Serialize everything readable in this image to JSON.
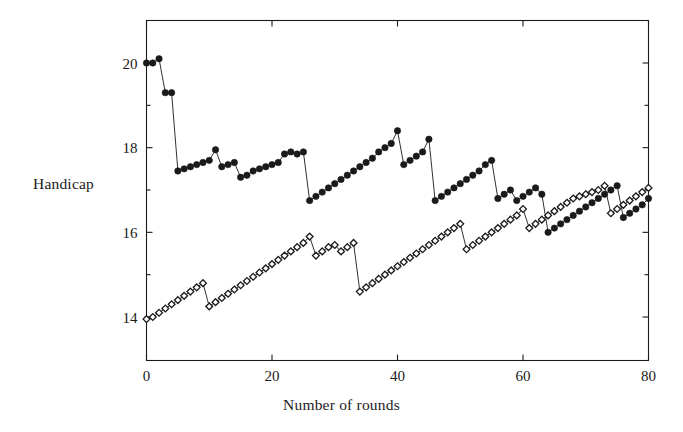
{
  "figure": {
    "background_color": "#ffffff",
    "ink_color": "#1a1a1a"
  },
  "axis": {
    "y_title": "Handicap",
    "x_title": "Number of rounds",
    "x_ticks": [
      "0",
      "20",
      "40",
      "60",
      "80"
    ],
    "y_ticks": [
      "14",
      "16",
      "18",
      "20"
    ]
  },
  "chart_data": {
    "type": "line",
    "title": "",
    "subtitle": "",
    "xlabel": "Number of rounds",
    "ylabel": "Handicap",
    "xlim": [
      0,
      80
    ],
    "ylim": [
      13.0,
      21.2
    ],
    "xticks": [
      0,
      20,
      40,
      60,
      80
    ],
    "yticks": [
      14,
      16,
      18,
      20
    ],
    "yticks_minor": [
      15,
      17,
      19
    ],
    "grid": false,
    "legend": "none",
    "frame": "box",
    "tick_direction": "in",
    "series": [
      {
        "name": "filled-circle-series",
        "marker": "filled-circle",
        "marker_color": "#1a1a1a",
        "line_color": "#1a1a1a",
        "x": [
          0,
          1,
          2,
          3,
          4,
          5,
          6,
          7,
          8,
          9,
          10,
          11,
          12,
          13,
          14,
          15,
          16,
          17,
          18,
          19,
          20,
          21,
          22,
          23,
          24,
          25,
          26,
          27,
          28,
          29,
          30,
          31,
          32,
          33,
          34,
          35,
          36,
          37,
          38,
          39,
          40,
          41,
          42,
          43,
          44,
          45,
          46,
          47,
          48,
          49,
          50,
          51,
          52,
          53,
          54,
          55,
          56,
          57,
          58,
          59,
          60,
          61,
          62,
          63,
          64,
          65,
          66,
          67,
          68,
          69,
          70,
          71,
          72,
          73,
          74,
          75,
          76,
          77,
          78,
          79,
          80
        ],
        "values": [
          20.0,
          20.0,
          20.1,
          19.3,
          19.3,
          17.45,
          17.5,
          17.55,
          17.6,
          17.65,
          17.7,
          17.95,
          17.55,
          17.6,
          17.65,
          17.3,
          17.35,
          17.45,
          17.5,
          17.55,
          17.6,
          17.65,
          17.85,
          17.9,
          17.85,
          17.9,
          16.75,
          16.85,
          16.95,
          17.05,
          17.15,
          17.25,
          17.35,
          17.45,
          17.55,
          17.65,
          17.75,
          17.9,
          18.0,
          18.1,
          18.4,
          17.6,
          17.7,
          17.8,
          17.9,
          18.2,
          16.75,
          16.85,
          16.95,
          17.05,
          17.15,
          17.25,
          17.35,
          17.45,
          17.6,
          17.7,
          16.8,
          16.9,
          17.0,
          16.75,
          16.85,
          16.95,
          17.05,
          16.9,
          16.0,
          16.1,
          16.2,
          16.3,
          16.4,
          16.5,
          16.6,
          16.7,
          16.8,
          16.9,
          17.0,
          17.1,
          16.35,
          16.45,
          16.55,
          16.65,
          16.8
        ]
      },
      {
        "name": "open-diamond-series",
        "marker": "open-diamond",
        "marker_color": "#ffffff",
        "line_color": "#1a1a1a",
        "x": [
          0,
          1,
          2,
          3,
          4,
          5,
          6,
          7,
          8,
          9,
          10,
          11,
          12,
          13,
          14,
          15,
          16,
          17,
          18,
          19,
          20,
          21,
          22,
          23,
          24,
          25,
          26,
          27,
          28,
          29,
          30,
          31,
          32,
          33,
          34,
          35,
          36,
          37,
          38,
          39,
          40,
          41,
          42,
          43,
          44,
          45,
          46,
          47,
          48,
          49,
          50,
          51,
          52,
          53,
          54,
          55,
          56,
          57,
          58,
          59,
          60,
          61,
          62,
          63,
          64,
          65,
          66,
          67,
          68,
          69,
          70,
          71,
          72,
          73,
          74,
          75,
          76,
          77,
          78,
          79,
          80
        ],
        "values": [
          13.95,
          14.0,
          14.1,
          14.2,
          14.3,
          14.4,
          14.5,
          14.6,
          14.7,
          14.8,
          14.25,
          14.35,
          14.45,
          14.55,
          14.65,
          14.75,
          14.85,
          14.95,
          15.05,
          15.15,
          15.25,
          15.35,
          15.45,
          15.55,
          15.65,
          15.75,
          15.9,
          15.45,
          15.55,
          15.65,
          15.7,
          15.55,
          15.65,
          15.75,
          14.6,
          14.7,
          14.8,
          14.9,
          15.0,
          15.1,
          15.2,
          15.3,
          15.4,
          15.5,
          15.6,
          15.7,
          15.8,
          15.9,
          16.0,
          16.1,
          16.2,
          15.6,
          15.7,
          15.8,
          15.9,
          16.0,
          16.1,
          16.2,
          16.3,
          16.4,
          16.55,
          16.1,
          16.2,
          16.3,
          16.4,
          16.5,
          16.6,
          16.7,
          16.8,
          16.85,
          16.9,
          16.95,
          17.0,
          17.1,
          16.45,
          16.55,
          16.65,
          16.75,
          16.85,
          16.95,
          17.05
        ]
      }
    ]
  }
}
